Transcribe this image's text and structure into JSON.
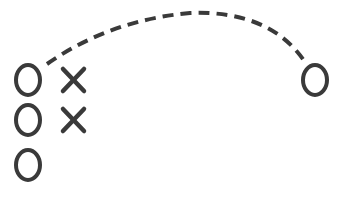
{
  "diagram": {
    "type": "play-diagram",
    "stroke_color": "#3a3a3a",
    "background": "#ffffff",
    "players_o": [
      {
        "id": "o1",
        "x": 28,
        "y": 80
      },
      {
        "id": "o2",
        "x": 28,
        "y": 120
      },
      {
        "id": "o3",
        "x": 28,
        "y": 165
      },
      {
        "id": "o4",
        "x": 315,
        "y": 80
      }
    ],
    "players_x": [
      {
        "id": "x1",
        "x": 73,
        "y": 80
      },
      {
        "id": "x2",
        "x": 73,
        "y": 120
      }
    ],
    "pass_path": {
      "style": "dashed",
      "from": "o1",
      "to": "o4"
    }
  }
}
